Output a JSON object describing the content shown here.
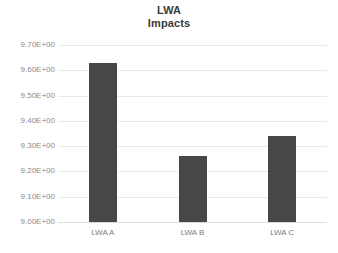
{
  "chart_data": {
    "type": "bar",
    "title": "LWA Impacts",
    "title_lines": [
      "LWA",
      "Impacts"
    ],
    "categories": [
      "LWA A",
      "LWA B",
      "LWA C"
    ],
    "values": [
      9.63,
      9.26,
      9.34
    ],
    "xlabel": "",
    "ylabel": "",
    "ylim": [
      9.0,
      9.7
    ],
    "ytick_labels": [
      "9.70E+00",
      "9.60E+00",
      "9.50E+00",
      "9.40E+00",
      "9.30E+00",
      "9.20E+00",
      "9.10E+00",
      "9.00E+00"
    ],
    "ytick_values": [
      9.7,
      9.6,
      9.5,
      9.4,
      9.3,
      9.2,
      9.1,
      9.0
    ],
    "grid": true,
    "grid_axis": "y",
    "legend": false,
    "legend_position": "none",
    "bar_color": "#474747",
    "gridline_color": "#e8e8e8",
    "background_color": "#ffffff",
    "title_color": "#3b3b3b",
    "tick_label_color": "#8a8a8a"
  }
}
